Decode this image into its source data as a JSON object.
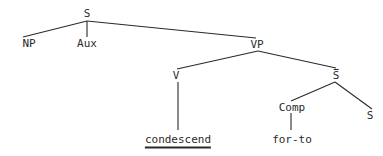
{
  "diagram": {
    "type": "syntax-tree",
    "nodes": {
      "S": "S",
      "NP": "NP",
      "Aux": "Aux",
      "VP": "VP",
      "V": "V",
      "Sbar": "S",
      "Comp": "Comp",
      "S2": "S",
      "verb": "condescend",
      "comp_value": "for-to"
    },
    "edges": [
      [
        "S",
        "NP"
      ],
      [
        "S",
        "Aux"
      ],
      [
        "S",
        "VP"
      ],
      [
        "VP",
        "V"
      ],
      [
        "VP",
        "Sbar"
      ],
      [
        "V",
        "condescend"
      ],
      [
        "Sbar",
        "Comp"
      ],
      [
        "Sbar",
        "S2"
      ],
      [
        "Comp",
        "for-to"
      ]
    ],
    "line_color": "#2a2a2a"
  }
}
